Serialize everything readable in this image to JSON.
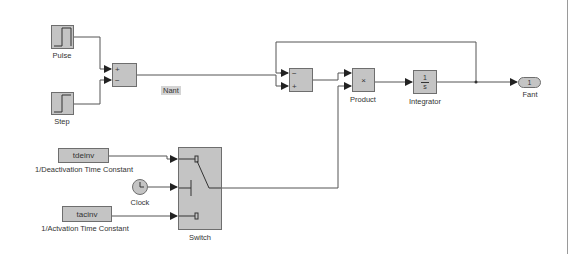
{
  "diagram": {
    "type": "simulink-block-diagram",
    "blocks": {
      "pulse": {
        "label": "Pulse",
        "kind": "pulse-generator"
      },
      "step": {
        "label": "Step",
        "kind": "step-source"
      },
      "sum1": {
        "kind": "sum",
        "signs": [
          "+",
          "−"
        ]
      },
      "sum2": {
        "kind": "sum",
        "signs": [
          "−",
          "+"
        ]
      },
      "product": {
        "label": "Product",
        "symbol": "×"
      },
      "integrator": {
        "label": "Integrator",
        "numerator": "1",
        "denominator": "s"
      },
      "outport": {
        "label": "Fant",
        "number": "1"
      },
      "tdeinv": {
        "value": "tdeinv",
        "label": "1/Deactivation Time Constant"
      },
      "clock": {
        "label": "Clock"
      },
      "tacinv": {
        "value": "tacinv",
        "label": "1/Actvation Time Constant"
      },
      "switch": {
        "label": "Switch"
      }
    },
    "signals": {
      "nant": {
        "label": "Nant"
      }
    },
    "colors": {
      "block_fill": "#c4c4c4",
      "block_border": "#6e6e6e",
      "line": "#555555",
      "background": "#ffffff"
    }
  }
}
